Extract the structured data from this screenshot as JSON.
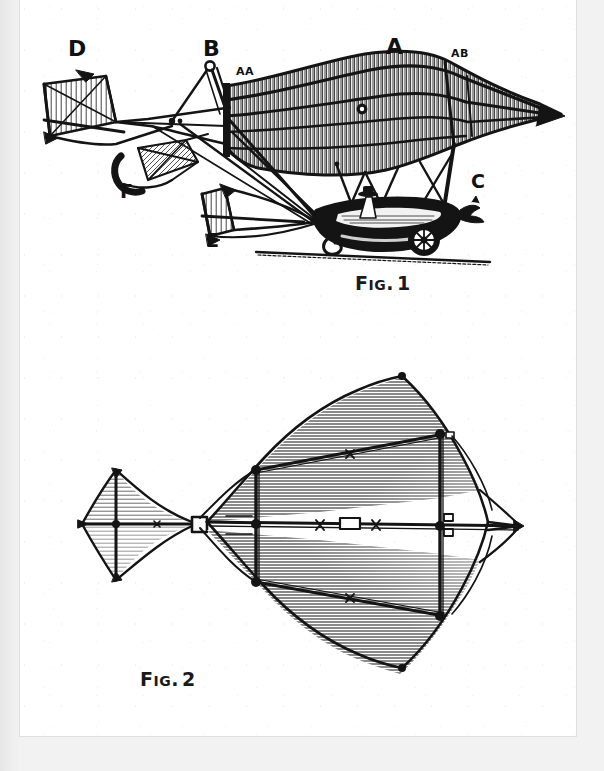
{
  "document": {
    "type": "engraving-plate",
    "subject": "early flying machine / aerial steam carriage",
    "background_color": "#e9e9e9",
    "page_color": "#ffffff",
    "ink_color": "#141414"
  },
  "figures": [
    {
      "id": "fig1",
      "caption_prefix": "F",
      "caption_small": "IG",
      "caption_dot": ".",
      "caption_number": "1",
      "caption_full": "Fig. 1",
      "view": "side elevation",
      "labels": [
        {
          "key": "D",
          "text": "D",
          "size": "big",
          "x": 48,
          "y": 34
        },
        {
          "key": "B",
          "text": "B",
          "size": "big",
          "x": 183,
          "y": 34
        },
        {
          "key": "AA",
          "text": "AA",
          "size": "small",
          "x": 216,
          "y": 62
        },
        {
          "key": "A",
          "text": "A",
          "size": "big",
          "x": 366,
          "y": 32
        },
        {
          "key": "AB",
          "text": "AB",
          "size": "small",
          "x": 431,
          "y": 44
        },
        {
          "key": "C",
          "text": "C",
          "size": "mid",
          "x": 451,
          "y": 168
        },
        {
          "key": "F",
          "text": "F",
          "size": "mid",
          "x": 100,
          "y": 178
        },
        {
          "key": "E",
          "text": "E",
          "size": "mid",
          "x": 186,
          "y": 227
        }
      ]
    },
    {
      "id": "fig2",
      "caption_prefix": "F",
      "caption_small": "IG",
      "caption_dot": ".",
      "caption_number": "2",
      "caption_full": "Fig. 2",
      "view": "plan view of wing frame",
      "labels": []
    }
  ]
}
